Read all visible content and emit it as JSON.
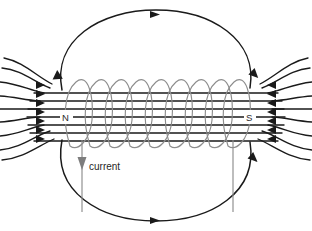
{
  "diagram": {
    "background_color": "#ffffff",
    "labels": {
      "north_pole": "N",
      "south_pole": "S",
      "current": "current"
    },
    "colors": {
      "field_line": "#1a1a1a",
      "coil": "#8d8d8d",
      "lead_wire": "#8d8d8d",
      "label_text": "#1f1f1f",
      "background": "#ffffff"
    },
    "coil": {
      "turns": 9,
      "left_x": 68,
      "right_x": 246,
      "top_y": 80,
      "bottom_y": 146
    },
    "field_lines": {
      "interior_count": 7,
      "exterior_left_count": 9,
      "exterior_right_count": 9,
      "outer_loop_count": 2,
      "arrow_direction_inside": "left-to-right",
      "arrow_direction_outside_left": "rightward-into-north",
      "arrow_direction_outside_right": "leftward-into-south"
    },
    "leads": {
      "left_lead_x": 82,
      "right_lead_x": 233,
      "current_arrow_direction": "down"
    }
  }
}
